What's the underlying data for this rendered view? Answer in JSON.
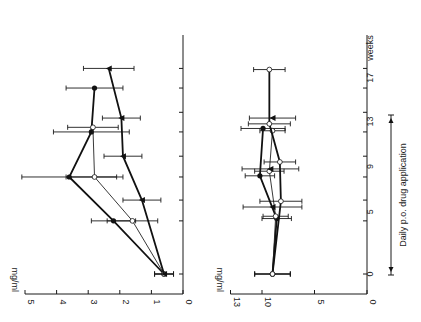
{
  "chart_data": [
    {
      "type": "line",
      "panel": "top",
      "orientation": "rotated-90-ccw",
      "ylabel": "mg/ml",
      "xlabel": "weeks",
      "ylim": [
        0,
        5
      ],
      "yticks": [
        "0",
        "1",
        "2",
        "3",
        "4",
        "5"
      ],
      "xticklabels": [
        "0",
        "5",
        "9",
        "13",
        "17"
      ],
      "series": [
        {
          "name": "filled circles",
          "marker": "filled-circle",
          "line": "thick",
          "x": [
            0,
            4.6,
            8.4,
            12.3,
            16.1
          ],
          "values": [
            0.6,
            2.2,
            3.6,
            2.9,
            2.8
          ],
          "err": [
            0.3,
            0.7,
            1.5,
            1.2,
            0.9
          ]
        },
        {
          "name": "open circles",
          "marker": "open-circle",
          "line": "thin",
          "x": [
            0,
            4.6,
            8.4,
            12.7
          ],
          "values": [
            0.6,
            1.6,
            2.8,
            2.85
          ],
          "err": [
            0.3,
            0.8,
            0.9,
            0.8
          ]
        },
        {
          "name": "triangles / open circles",
          "marker": "filled-triangle",
          "line": "thick",
          "x": [
            0,
            6.4,
            10.2,
            13.5,
            17.8
          ],
          "values": [
            0.6,
            1.3,
            1.9,
            1.95,
            2.35
          ],
          "err": [
            0.3,
            0.6,
            0.6,
            0.6,
            0.8
          ]
        }
      ]
    },
    {
      "type": "line",
      "panel": "bottom",
      "orientation": "rotated-90-ccw",
      "ylabel": "mg/ml",
      "xlabel": "weeks",
      "ylim": [
        0,
        13
      ],
      "yticks": [
        "0",
        "5",
        "10",
        "13"
      ],
      "xticklabels": [
        "0",
        "5",
        "9",
        "13",
        "17"
      ],
      "series": [
        {
          "name": "filled circles",
          "marker": "filled-circle",
          "line": "thick",
          "x": [
            0,
            4.8,
            8.5,
            12.6
          ],
          "values": [
            9.0,
            8.6,
            10.2,
            9.9
          ],
          "err": [
            1.7,
            1.4,
            1.4,
            2.1
          ]
        },
        {
          "name": "open circles",
          "marker": "open-circle",
          "line": "thin",
          "x": [
            0,
            5.0,
            8.9,
            12.4
          ],
          "values": [
            9.0,
            8.7,
            9.3,
            9.0
          ],
          "err": [
            1.7,
            1.2,
            1.4,
            1.2
          ]
        },
        {
          "name": "triangles / open circles",
          "marker": "open-circle",
          "line": "thick",
          "x": [
            0,
            6.3,
            9.7,
            13.0,
            17.7
          ],
          "values": [
            9.0,
            8.2,
            8.3,
            9.3,
            9.3
          ],
          "err": [
            1.7,
            2.0,
            1.5,
            2.0,
            1.5
          ]
        },
        {
          "name": "triangles",
          "marker": "filled-triangle",
          "line": "none",
          "x": [
            5.8,
            9.1,
            13.5
          ],
          "values": [
            9.0,
            9.2,
            9.0
          ],
          "err": [
            2.8,
            2.7,
            2.2
          ]
        }
      ]
    }
  ],
  "labels": {
    "top_unit": "mg/ml",
    "bottom_unit": "mg/ml",
    "weeks": "weeks",
    "annotation": "Daily p.o. drug application"
  }
}
